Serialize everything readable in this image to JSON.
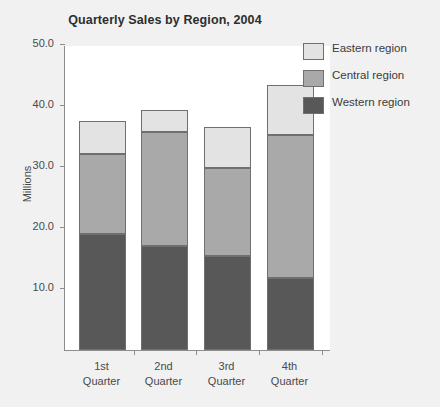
{
  "chart_data": {
    "type": "bar",
    "subtype": "stacked-vertical",
    "title": "Quarterly Sales by Region, 2004",
    "xlabel": "",
    "ylabel": "Millions",
    "ylim": [
      0,
      50
    ],
    "ytick_values": [
      10,
      20,
      30,
      40,
      50
    ],
    "ytick_labels": [
      "10.0",
      "20.0",
      "30.0",
      "40.0",
      "50.0"
    ],
    "grid": false,
    "legend_position": "top-right",
    "categories": [
      "1st Quarter",
      "2nd Quarter",
      "3rd Quarter",
      "4th Quarter"
    ],
    "category_lines": [
      [
        "1st",
        "Quarter"
      ],
      [
        "2nd",
        "Quarter"
      ],
      [
        "3rd",
        "Quarter"
      ],
      [
        "4th",
        "Quarter"
      ]
    ],
    "series": [
      {
        "name": "Western region",
        "color": "#585858",
        "values": [
          19.0,
          17.0,
          15.4,
          11.8
        ]
      },
      {
        "name": "Central region",
        "color": "#a9a9a9",
        "values": [
          13.2,
          18.7,
          14.4,
          23.4
        ]
      },
      {
        "name": "Eastern region",
        "color": "#e3e3e3",
        "values": [
          5.3,
          3.6,
          6.8,
          8.2
        ]
      }
    ],
    "stack_totals": [
      37.5,
      39.3,
      36.6,
      43.4
    ],
    "stack_order_bottom_to_top": [
      "Western region",
      "Central region",
      "Eastern region"
    ]
  },
  "legend": {
    "items": [
      {
        "label": "Eastern region",
        "color": "#e3e3e3"
      },
      {
        "label": "Central region",
        "color": "#a9a9a9"
      },
      {
        "label": "Western region",
        "color": "#585858"
      }
    ]
  },
  "colors": {
    "eastern": "#e3e3e3",
    "central": "#a9a9a9",
    "western": "#585858",
    "axis": "#8d8d8d",
    "background": "#f1f1f1",
    "plot_background": "#ffffff"
  }
}
